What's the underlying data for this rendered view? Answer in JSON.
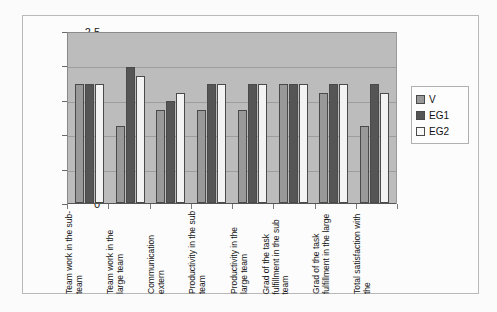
{
  "chart_data": {
    "type": "bar",
    "title": "",
    "xlabel": "",
    "ylabel": "",
    "ylim": [
      0,
      2.5
    ],
    "ytick_labels": [
      "0",
      "0,5",
      "1",
      "1,5",
      "2",
      "2,5"
    ],
    "ytick_values": [
      0,
      0.5,
      1,
      1.5,
      2,
      2.5
    ],
    "grid": true,
    "legend_position": "right",
    "categories": [
      "Team work in the sub-team",
      "Team work in the large team",
      "Communication extern",
      "Productivity in the sub team",
      "Productivity in the large team",
      "Grad of the task fulfillment in the sub team",
      "Grad of the task fulfillment in the large",
      "Total satisfaction with the"
    ],
    "series": [
      {
        "name": "V",
        "color": "#999999",
        "values": [
          1.75,
          1.13,
          1.37,
          1.37,
          1.37,
          1.75,
          1.62,
          1.13
        ]
      },
      {
        "name": "EG1",
        "color": "#555555",
        "values": [
          1.75,
          2.0,
          1.5,
          1.75,
          1.75,
          1.75,
          1.75,
          1.75
        ]
      },
      {
        "name": "EG2",
        "color": "#f3f3f3",
        "values": [
          1.75,
          1.87,
          1.62,
          1.75,
          1.75,
          1.75,
          1.75,
          1.62
        ]
      }
    ]
  },
  "legend": {
    "items": [
      {
        "label": "V"
      },
      {
        "label": "EG1"
      },
      {
        "label": "EG2"
      }
    ]
  }
}
